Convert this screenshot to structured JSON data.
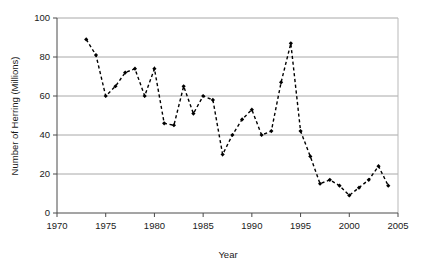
{
  "chart_data": {
    "type": "line",
    "title": "",
    "xlabel": "Year",
    "ylabel": "Number of Herring (Millions)",
    "xlim": [
      1970,
      2005
    ],
    "ylim": [
      0,
      100
    ],
    "xticks": [
      1970,
      1975,
      1980,
      1985,
      1990,
      1995,
      2000,
      2005
    ],
    "xtick_labels": [
      "1970",
      "1975",
      "1980",
      "1985",
      "1990",
      "1995",
      "2000",
      "2005"
    ],
    "yticks": [
      0,
      20,
      40,
      60,
      80,
      100
    ],
    "ytick_labels": [
      "0",
      "20",
      "40",
      "60",
      "80",
      "100"
    ],
    "grid": "horizontal",
    "legend": null,
    "line_style": "dashed",
    "marker": "filled-diamond",
    "series": [
      {
        "name": "Number of Herring (Millions)",
        "x": [
          1973,
          1974,
          1975,
          1976,
          1977,
          1978,
          1979,
          1980,
          1981,
          1982,
          1983,
          1984,
          1985,
          1986,
          1987,
          1988,
          1989,
          1990,
          1991,
          1992,
          1993,
          1994,
          1995,
          1996,
          1997,
          1998,
          1999,
          2000,
          2001,
          2002,
          2003,
          2004
        ],
        "values": [
          89,
          81,
          60,
          65,
          72,
          74,
          60,
          74,
          46,
          45,
          65,
          51,
          60,
          58,
          30,
          40,
          48,
          53,
          40,
          42,
          67,
          87,
          42,
          29,
          15,
          17,
          14,
          9,
          13,
          17,
          24,
          14
        ]
      }
    ]
  },
  "colors": {
    "series": "#000000",
    "grid": "#a8a8a8",
    "axis": "#4a4a4a",
    "background": "#ffffff"
  }
}
